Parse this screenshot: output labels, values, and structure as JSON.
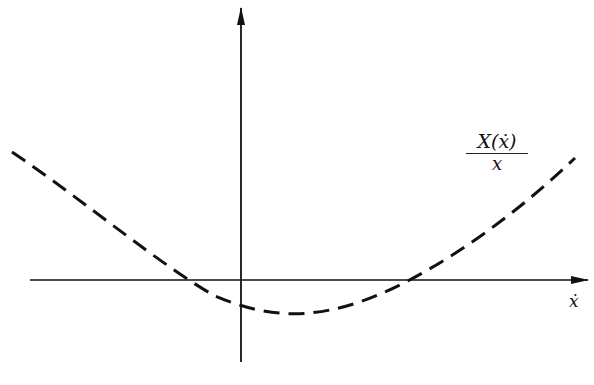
{
  "diagram": {
    "curve_label_numerator": "X(ẋ)",
    "curve_label_denominator": "x",
    "x_axis_label": "ẋ",
    "caption": "",
    "colors": {
      "background": "#ffffff",
      "stroke": "#111111"
    },
    "axes": {
      "origin_px": [
        241,
        280
      ],
      "x_axis_px": [
        30,
        588
      ],
      "y_axis_px": [
        362,
        10
      ]
    },
    "curve": {
      "style": "dashed",
      "shape": "upward parabola",
      "start_px": [
        12,
        152
      ],
      "left_crossing_px": [
        172,
        280
      ],
      "y_intercept_px": [
        241,
        305
      ],
      "minimum_px": [
        295,
        313
      ],
      "right_crossing_px": [
        418,
        280
      ],
      "end_px": [
        575,
        158
      ]
    }
  }
}
